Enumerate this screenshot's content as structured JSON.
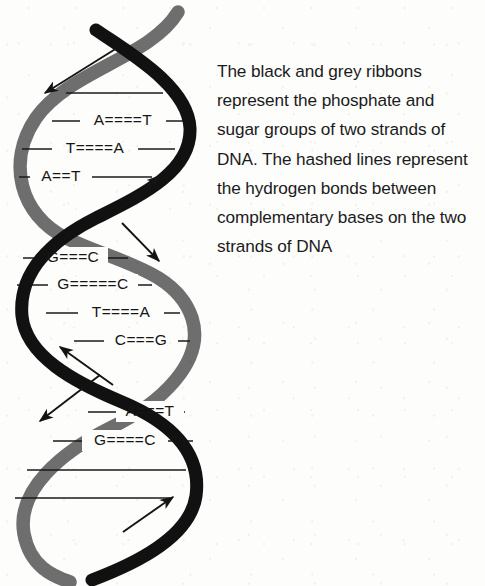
{
  "figure": {
    "background_color": "#fdfdfc",
    "colors": {
      "black_ribbon": "#111111",
      "grey_ribbon": "#6e6e6e",
      "rung_line": "#1a1a1a",
      "text": "#1b1b1b",
      "arrow": "#141414"
    }
  },
  "caption": {
    "text": "The black and grey ribbons represent the phosphate and sugar groups of two strands of DNA. The hashed lines represent the hydrogen bonds between complementary bases on the two strands of DNA",
    "lines": [
      "The black and grey",
      "ribbons represent the",
      "phosphate and sugar",
      "groups of two strands",
      "of DNA. The hashed",
      "lines represent the",
      "hydrogen bonds",
      "between complementary",
      "bases on the two",
      "strands of DNA"
    ]
  },
  "helix": {
    "strands": [
      {
        "name": "grey-strand",
        "color": "#6e6e6e",
        "label": "grey ribbon"
      },
      {
        "name": "black-strand",
        "color": "#111111",
        "label": "black ribbon"
      }
    ],
    "rungs": [
      {
        "id": "rung-1",
        "y": 93,
        "x1": 66,
        "x2": 163,
        "labelled": false,
        "left_base": "",
        "bond": "",
        "right_base": ""
      },
      {
        "id": "rung-2",
        "y": 121,
        "x1": 52,
        "x2": 184,
        "labelled": true,
        "left_base": "A",
        "bond": "====",
        "right_base": "T"
      },
      {
        "id": "rung-3",
        "y": 149,
        "x1": 22,
        "x2": 175,
        "labelled": true,
        "left_base": "T",
        "bond": "====",
        "right_base": "A"
      },
      {
        "id": "rung-4",
        "y": 177,
        "x1": 19,
        "x2": 152,
        "labelled": true,
        "left_base": "A",
        "bond": "==",
        "right_base": "T"
      },
      {
        "id": "rung-5",
        "y": 258,
        "x1": 23,
        "x2": 128,
        "labelled": true,
        "left_base": "G",
        "bond": "===",
        "right_base": "C"
      },
      {
        "id": "rung-6",
        "y": 285,
        "x1": 17,
        "x2": 152,
        "labelled": true,
        "left_base": "G",
        "bond": "=====",
        "right_base": "C"
      },
      {
        "id": "rung-7",
        "y": 313,
        "x1": 46,
        "x2": 180,
        "labelled": true,
        "left_base": "T",
        "bond": "====",
        "right_base": "A"
      },
      {
        "id": "rung-8",
        "y": 341,
        "x1": 74,
        "x2": 190,
        "labelled": true,
        "left_base": "C",
        "bond": "===",
        "right_base": "G"
      },
      {
        "id": "rung-9",
        "y": 412,
        "x1": 88,
        "x2": 185,
        "labelled": true,
        "left_base": "A",
        "bond": "===",
        "right_base": "T"
      },
      {
        "id": "rung-10",
        "y": 441,
        "x1": 53,
        "x2": 193,
        "labelled": true,
        "left_base": "G",
        "bond": "====",
        "right_base": "C"
      },
      {
        "id": "rung-11",
        "y": 470,
        "x1": 27,
        "x2": 186,
        "labelled": false,
        "left_base": "",
        "bond": "",
        "right_base": ""
      },
      {
        "id": "rung-12",
        "y": 498,
        "x1": 15,
        "x2": 170,
        "labelled": false,
        "left_base": "",
        "bond": "",
        "right_base": ""
      }
    ],
    "base_pairs_sequence": [
      "A====T",
      "T====A",
      "A==T",
      "G===C",
      "G=====C",
      "T====A",
      "C===G",
      "A===T",
      "G====C"
    ],
    "arrows": [
      {
        "id": "arrow-top-left",
        "direction": "down-left",
        "from": [
          117,
          48
        ],
        "to": [
          41,
          96
        ]
      },
      {
        "id": "arrow-upper-right",
        "direction": "up-right",
        "from": [
          122,
          207
        ],
        "to": [
          163,
          173
        ]
      },
      {
        "id": "arrow-middle-right",
        "direction": "down-right",
        "from": [
          122,
          223
        ],
        "to": [
          162,
          264
        ]
      },
      {
        "id": "arrow-middle-left",
        "direction": "up-left",
        "from": [
          113,
          385
        ],
        "to": [
          57,
          344
        ]
      },
      {
        "id": "arrow-lower-left",
        "direction": "down-left",
        "from": [
          100,
          375
        ],
        "to": [
          36,
          424
        ]
      },
      {
        "id": "arrow-bottom-right",
        "direction": "up-right",
        "from": [
          123,
          532
        ],
        "to": [
          176,
          494
        ]
      }
    ]
  }
}
